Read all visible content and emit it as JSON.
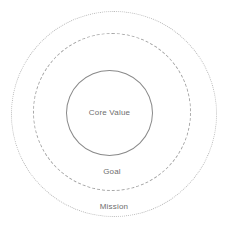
{
  "diagram": {
    "type": "concentric-circles",
    "canvas": {
      "width": 227,
      "height": 233,
      "background": "#ffffff"
    },
    "rings": [
      {
        "id": "mission",
        "level": 3,
        "label": "Mission",
        "stroke_style": "dotted",
        "stroke_color": "#b9b9b9",
        "label_color": "#6e6e6e",
        "diameter": 206,
        "center_x": 114,
        "center_y": 114
      },
      {
        "id": "goal",
        "level": 2,
        "label": "Goal",
        "stroke_style": "dashed",
        "stroke_color": "#a6a6a6",
        "label_color": "#6e6e6e",
        "diameter": 158,
        "center_x": 112,
        "center_y": 112
      },
      {
        "id": "core-value",
        "level": 1,
        "label": "Core Value",
        "stroke_style": "solid",
        "stroke_color": "#8a8a8a",
        "label_color": "#6e6e6e",
        "diameter": 86,
        "center_x": 110,
        "center_y": 113
      }
    ]
  }
}
